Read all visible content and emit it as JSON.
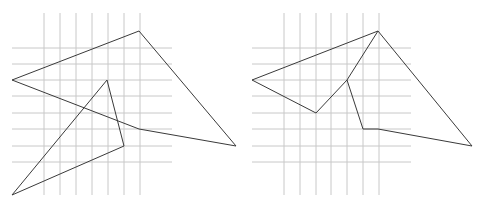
{
  "colors": {
    "background": "#ffffff",
    "grid": "#c8c8c8",
    "stroke": "#3a3a3a"
  },
  "panels": [
    {
      "name": "left-panel",
      "grid": {
        "vertical_x": [
          44,
          60,
          76,
          92,
          108,
          124,
          140
        ],
        "vertical_y_range": [
          13,
          195
        ],
        "horizontal_y": [
          48,
          64,
          80,
          96,
          113,
          129,
          146,
          162
        ],
        "horizontal_x_range": [
          12,
          172
        ]
      },
      "shapes": [
        {
          "name": "quadrilateral",
          "points": [
            [
              12,
              80
            ],
            [
              139,
              31
            ],
            [
              236,
              146
            ],
            [
              139,
              129
            ]
          ],
          "closed": true
        },
        {
          "name": "triangle",
          "points": [
            [
              107,
              80
            ],
            [
              124,
              146
            ],
            [
              12,
              195
            ]
          ],
          "closed": true
        }
      ]
    },
    {
      "name": "right-panel",
      "grid": {
        "vertical_x": [
          284,
          300,
          316,
          331,
          347,
          363,
          379
        ],
        "vertical_y_range": [
          13,
          195
        ],
        "horizontal_y": [
          48,
          64,
          80,
          96,
          113,
          129,
          146,
          162
        ],
        "horizontal_x_range": [
          252,
          411
        ]
      },
      "shapes": [
        {
          "name": "union-outline",
          "points": [
            [
              252,
              80
            ],
            [
              378,
              31
            ],
            [
              472,
              146
            ],
            [
              378,
              129
            ],
            [
              363,
              129
            ],
            [
              347,
              80
            ],
            [
              316,
              113
            ]
          ],
          "closed": true
        },
        {
          "name": "inner-edge",
          "points": [
            [
              347,
              80
            ],
            [
              378,
              31
            ]
          ],
          "closed": false
        }
      ]
    }
  ]
}
